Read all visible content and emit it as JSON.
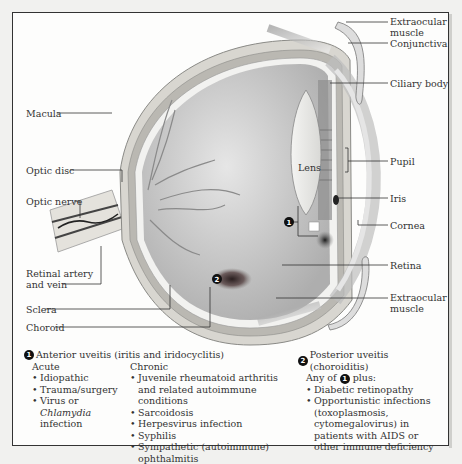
{
  "diagram": {
    "labels_right": [
      {
        "id": "extraocular-muscle-top",
        "text": "Extraocular muscle"
      },
      {
        "id": "conjunctiva",
        "text": "Conjunctiva"
      },
      {
        "id": "ciliary-body",
        "text": "Ciliary body"
      },
      {
        "id": "pupil",
        "text": "Pupil"
      },
      {
        "id": "iris",
        "text": "Iris"
      },
      {
        "id": "cornea",
        "text": "Cornea"
      },
      {
        "id": "retina",
        "text": "Retina"
      },
      {
        "id": "extraocular-muscle-bottom",
        "text": "Extraocular muscle"
      }
    ],
    "labels_left": [
      {
        "id": "macula",
        "text": "Macula"
      },
      {
        "id": "optic-disc",
        "text": "Optic disc"
      },
      {
        "id": "optic-nerve",
        "text": "Optic nerve"
      },
      {
        "id": "retinal-artery-vein",
        "text": "Retinal artery and vein"
      },
      {
        "id": "sclera",
        "text": "Sclera"
      },
      {
        "id": "choroid",
        "text": "Choroid"
      }
    ],
    "lens_label": "Lens",
    "markers": [
      {
        "id": 1,
        "text": "1",
        "location": "anterior"
      },
      {
        "id": 2,
        "text": "2",
        "location": "posterior"
      }
    ]
  },
  "legend": {
    "anterior": {
      "marker": "1",
      "title": "Anterior uveitis (iritis and iridocyclitis)",
      "acute": {
        "heading": "Acute",
        "items": [
          "Idiopathic",
          "Trauma/surgery",
          "Virus or Chlamydia infection"
        ],
        "italic_word": "Chlamydia"
      },
      "chronic": {
        "heading": "Chronic",
        "items": [
          "Juvenile rheumatoid arthritis and related autoimmune conditions",
          "Sarcoidosis",
          "Herpesvirus infection",
          "Syphilis",
          "Sympathetic (autoimmune) ophthalmitis"
        ]
      }
    },
    "posterior": {
      "marker": "2",
      "title": "Posterior uveitis (choroiditis)",
      "any_of_prefix": "Any of",
      "any_of_marker": "1",
      "any_of_suffix": "plus:",
      "items": [
        "Diabetic retinopathy",
        "Opportunistic infections (toxoplasmosis, cytomegalovirus) in patients with AIDS or other immune deficiency"
      ]
    }
  },
  "colors": {
    "frame_border": "#333333",
    "background": "#f1f1ef",
    "sclera": "#d8d6d0",
    "vitreous": "#c9c9c9",
    "lesion": "#3a2f2f",
    "marker": "#111111"
  }
}
